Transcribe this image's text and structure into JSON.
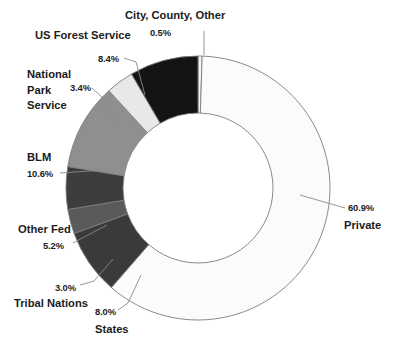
{
  "chart_data": {
    "type": "pie",
    "variant": "donut",
    "title": "",
    "subtitle": "",
    "xlabel": "",
    "ylabel": "",
    "legend": "none",
    "grid": false,
    "units": "percent",
    "total": 100.0,
    "center": {
      "cx": 198,
      "cy": 188
    },
    "outer_radius": 132,
    "inner_radius": 75,
    "start_angle_deg": 0,
    "direction": "clockwise",
    "categories": [
      "City, County, Other",
      "Private",
      "States",
      "Tribal Nations",
      "Other Fed",
      "BLM",
      "National Park Service",
      "US Forest Service"
    ],
    "values": [
      0.5,
      60.9,
      8.0,
      3.0,
      5.2,
      10.6,
      3.4,
      8.4
    ],
    "slices": [
      {
        "label": "City, County, Other",
        "label_lines": [
          "City, County, Other"
        ],
        "percent_text": "0.5%",
        "value": 0.5,
        "color": "#f4f4f4",
        "stroke": "#7d7d7d"
      },
      {
        "label": "Private",
        "label_lines": [
          "Private"
        ],
        "percent_text": "60.9%",
        "value": 60.9,
        "color": "#fbfbfb",
        "stroke": "#6f6f6f"
      },
      {
        "label": "States",
        "label_lines": [
          "States"
        ],
        "percent_text": "8.0%",
        "value": 8.0,
        "color": "#3a3a3a",
        "stroke": "#7d7d7d"
      },
      {
        "label": "Tribal Nations",
        "label_lines": [
          "Tribal Nations"
        ],
        "percent_text": "3.0%",
        "value": 3.0,
        "color": "#5a5a5a",
        "stroke": "#7d7d7d"
      },
      {
        "label": "Other Fed",
        "label_lines": [
          "Other Fed"
        ],
        "percent_text": "5.2%",
        "value": 5.2,
        "color": "#3d3d3d",
        "stroke": "#7d7d7d"
      },
      {
        "label": "BLM",
        "label_lines": [
          "BLM"
        ],
        "percent_text": "10.6%",
        "value": 10.6,
        "color": "#8f8f8f",
        "stroke": "#7d7d7d"
      },
      {
        "label": "National Park Service",
        "label_lines": [
          "National",
          "Park",
          "Service"
        ],
        "percent_text": "3.4%",
        "value": 3.4,
        "color": "#e8e8e8",
        "stroke": "#7d7d7d"
      },
      {
        "label": "US Forest Service",
        "label_lines": [
          "US Forest Service"
        ],
        "percent_text": "8.4%",
        "value": 8.4,
        "color": "#141414",
        "stroke": "#7d7d7d"
      }
    ]
  },
  "labels": {
    "city_name": "City, County, Other",
    "city_pct": "0.5%",
    "usfs_name": "US Forest Service",
    "usfs_pct": "8.4%",
    "nps_line1": "National",
    "nps_line2": "Park",
    "nps_line3": "Service",
    "nps_pct": "3.4%",
    "blm_name": "BLM",
    "blm_pct": "10.6%",
    "other_fed_name": "Other Fed",
    "other_fed_pct": "5.2%",
    "tribal_name": "Tribal Nations",
    "tribal_pct": "3.0%",
    "states_name": "States",
    "states_pct": "8.0%",
    "private_name": "Private",
    "private_pct": "60.9%"
  }
}
